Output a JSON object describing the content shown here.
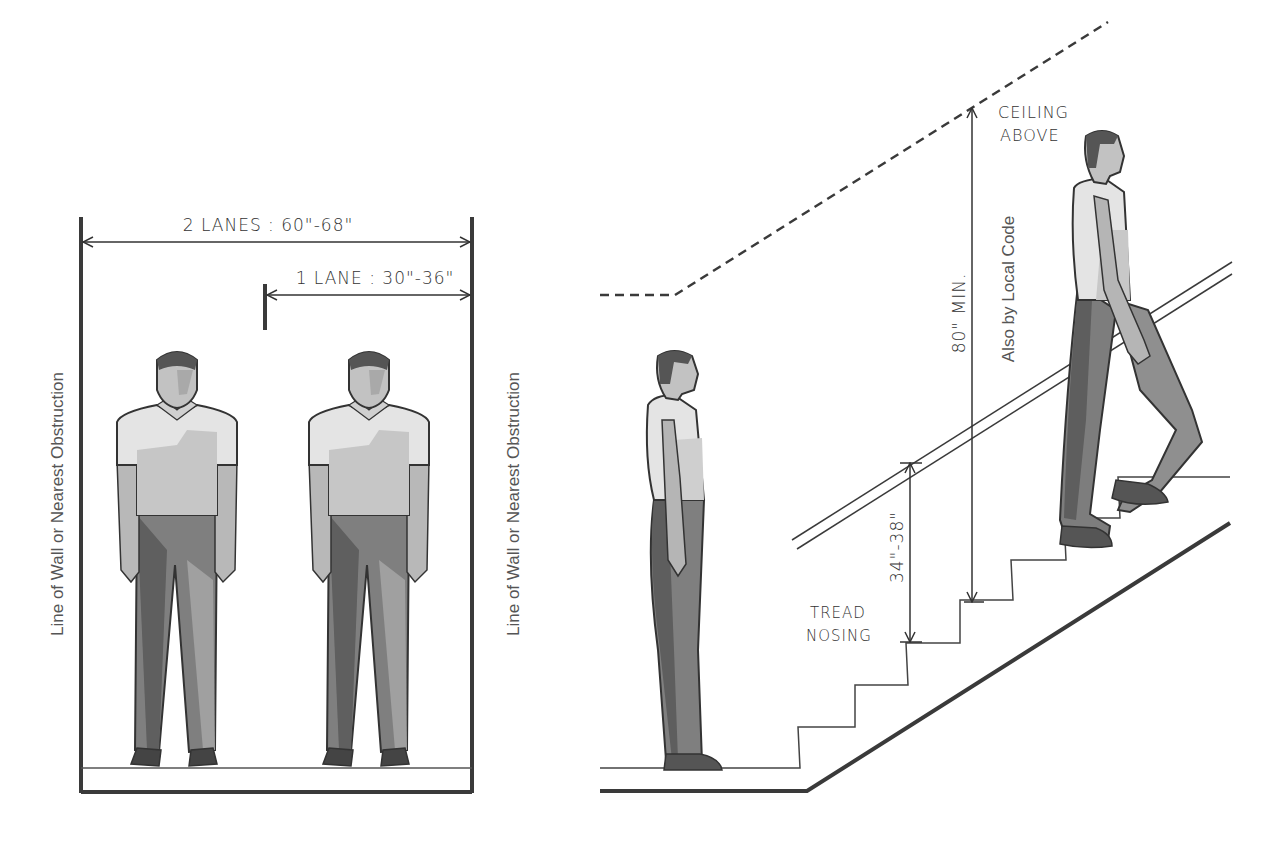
{
  "left_panel": {
    "title": "Corridor / stair width lanes",
    "dim_two_lanes": "2 LANES : 60\"-68\"",
    "dim_one_lane": "1 LANE : 30\"-36\"",
    "wall_label_left": "Line of Wall or Nearest Obstruction",
    "wall_label_right": "Line of Wall or Nearest Obstruction"
  },
  "right_panel": {
    "ceiling_label_line1": "CEILING",
    "ceiling_label_line2": "ABOVE",
    "headroom_dim": "80\" MIN.",
    "headroom_note": "Also by Local Code",
    "handrail_dim": "34\"-38\"",
    "nosing_label_line1": "TREAD",
    "nosing_label_line2": "NOSING"
  },
  "colors": {
    "line": "#3a3a3a",
    "shirt_light": "#e6e6e6",
    "shirt_mid": "#c4c4c4",
    "pants_mid": "#8a8a8a",
    "pants_dark": "#6a6a6a",
    "skin": "#bdbdbd"
  }
}
